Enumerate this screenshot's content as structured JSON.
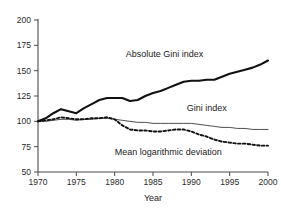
{
  "chart_data": {
    "type": "line",
    "title": "",
    "subtitle": "",
    "xlabel": "Year",
    "ylabel": "",
    "xlim": [
      1970,
      2000
    ],
    "ylim": [
      50,
      200
    ],
    "grid": false,
    "legend_position": "inline-annotations",
    "xticks": [
      1970,
      1975,
      1980,
      1985,
      1990,
      1995,
      2000
    ],
    "xtick_labels": [
      "1970",
      "1975",
      "1980",
      "1985",
      "1990",
      "1995",
      "2000"
    ],
    "yticks": [
      50,
      75,
      100,
      125,
      150,
      175,
      200
    ],
    "ytick_labels": [
      "50",
      "75",
      "100",
      "125",
      "150",
      "175",
      "200"
    ],
    "x": [
      1970,
      1971,
      1972,
      1973,
      1974,
      1975,
      1976,
      1977,
      1978,
      1979,
      1980,
      1981,
      1982,
      1983,
      1984,
      1985,
      1986,
      1987,
      1988,
      1989,
      1990,
      1991,
      1992,
      1993,
      1994,
      1995,
      1996,
      1997,
      1998,
      1999,
      2000
    ],
    "series": [
      {
        "name": "Absolute Gini index",
        "style": "solid-thick",
        "color": "#111111",
        "values": [
          100,
          103,
          108,
          112,
          110,
          108,
          113,
          117,
          121,
          123,
          123,
          123,
          120,
          121,
          125,
          128,
          130,
          133,
          136,
          139,
          140,
          140,
          141,
          141,
          144,
          147,
          149,
          151,
          153,
          156,
          160
        ]
      },
      {
        "name": "Gini index",
        "style": "solid-thin",
        "color": "#3a3a3a",
        "values": [
          100,
          100,
          101,
          102,
          102,
          101,
          102,
          102,
          103,
          103,
          102,
          101,
          100,
          99,
          99,
          98,
          98,
          98,
          98,
          98,
          98,
          97,
          96,
          95,
          94,
          94,
          93,
          93,
          92,
          92,
          92
        ]
      },
      {
        "name": "Mean logarithmic deviation",
        "style": "dashed",
        "color": "#111111",
        "values": [
          100,
          101,
          102,
          104,
          103,
          102,
          102,
          103,
          103,
          104,
          102,
          96,
          92,
          91,
          91,
          90,
          90,
          91,
          92,
          92,
          90,
          87,
          85,
          82,
          80,
          79,
          78,
          78,
          77,
          76,
          76
        ]
      }
    ],
    "annotations": [
      {
        "text": "Absolute Gini index",
        "x": 1986.5,
        "y": 163
      },
      {
        "text": "Gini index",
        "x": 1992.0,
        "y": 110
      },
      {
        "text": "Mean logarithmic deviation",
        "x": 1987.0,
        "y": 66.5
      }
    ]
  }
}
